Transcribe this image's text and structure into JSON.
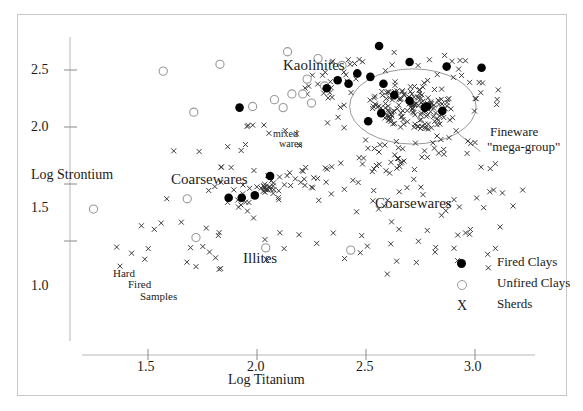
{
  "chart_data": {
    "type": "scatter",
    "title": "",
    "xlabel": "Log Titanium",
    "ylabel": "Log Strontium",
    "xlim": [
      1.22,
      3.26
    ],
    "ylim": [
      0.62,
      2.82
    ],
    "xticks": [
      1.5,
      2.0,
      2.5,
      3.0
    ],
    "xtick_labels": [
      "1.5",
      "2.0",
      "2.5",
      "3.0"
    ],
    "yticks": [
      1.0,
      1.5,
      2.0,
      2.5
    ],
    "ytick_labels": [
      "1.0",
      "1.5",
      "2.0",
      "2.5"
    ],
    "grid": false,
    "legend_position": "lower-right",
    "series": [
      {
        "name": "Fired Clays",
        "marker": "filled-circle",
        "color": "#000000",
        "points": [
          [
            2.56,
            2.71
          ],
          [
            2.7,
            2.57
          ],
          [
            2.87,
            2.53
          ],
          [
            3.03,
            2.52
          ],
          [
            2.46,
            2.47
          ],
          [
            2.52,
            2.44
          ],
          [
            2.37,
            2.41
          ],
          [
            2.42,
            2.38
          ],
          [
            2.32,
            2.34
          ],
          [
            2.58,
            2.38
          ],
          [
            2.63,
            2.28
          ],
          [
            2.7,
            2.23
          ],
          [
            2.77,
            2.17
          ],
          [
            2.85,
            2.14
          ],
          [
            1.92,
            2.17
          ],
          [
            2.57,
            2.12
          ],
          [
            2.06,
            1.57
          ],
          [
            1.87,
            1.38
          ],
          [
            1.93,
            1.38
          ],
          [
            1.99,
            1.4
          ],
          [
            2.78,
            2.18
          ],
          [
            2.51,
            2.05
          ]
        ]
      },
      {
        "name": "Unfired Clays",
        "marker": "open-circle",
        "color": "#9a9a9a",
        "points": [
          [
            2.14,
            2.66
          ],
          [
            1.83,
            2.55
          ],
          [
            2.39,
            2.54
          ],
          [
            1.57,
            2.49
          ],
          [
            2.23,
            2.42
          ],
          [
            2.31,
            2.36
          ],
          [
            2.16,
            2.29
          ],
          [
            2.21,
            2.29
          ],
          [
            2.08,
            2.24
          ],
          [
            2.25,
            2.21
          ],
          [
            1.98,
            2.18
          ],
          [
            2.12,
            2.17
          ],
          [
            1.71,
            2.13
          ],
          [
            2.28,
            2.6
          ],
          [
            1.25,
            1.28
          ],
          [
            1.72,
            1.03
          ],
          [
            2.04,
            0.94
          ],
          [
            2.43,
            0.92
          ],
          [
            1.68,
            1.37
          ]
        ]
      },
      {
        "name": "Sherds",
        "marker": "x",
        "color": "#333333",
        "note": "Approximately 300 sherd points; the densest concentration lies inside the Fineware mega-group ellipse centred near (2.72, 2.18)."
      }
    ],
    "annotations": [
      {
        "text": "Kaolinites",
        "x": 2.42,
        "y": 2.56,
        "style": "big"
      },
      {
        "text": "Coarsewares",
        "x": 1.83,
        "y": 1.76,
        "style": "big"
      },
      {
        "text": "Coarsewares",
        "x": 2.68,
        "y": 1.6,
        "style": "big"
      },
      {
        "text": "Illites",
        "x": 2.0,
        "y": 1.18,
        "style": "big"
      },
      {
        "text": "mixed wares",
        "x": 2.24,
        "y": 2.02,
        "style": "small"
      },
      {
        "text": "Hard Fired Samples",
        "x": 1.48,
        "y": 1.06,
        "style": "small"
      },
      {
        "text": "Fineware \"mega-group\"",
        "x": 3.02,
        "y": 1.98,
        "style": "note"
      }
    ],
    "ellipse": {
      "label": "Fineware \"mega-group\"",
      "center_x": 2.715,
      "center_y": 2.18,
      "radius_x": 0.29,
      "radius_y": 0.33
    }
  },
  "axes": {
    "x_title": "Log Titanium",
    "y_title": "Log Strontium",
    "x_tick_labels": [
      "1.5",
      "2.0",
      "2.5",
      "3.0"
    ],
    "y_tick_labels": [
      "1.0",
      "1.5",
      "2.0",
      "2.5"
    ]
  },
  "labels": {
    "kaolinites": "Kaolinites",
    "coarsewares_left": "Coarsewares",
    "coarsewares_right": "Coarsewares",
    "illites": "Illites",
    "mixed": "mixed",
    "wares": "wares",
    "hard": "Hard",
    "fired": "Fired",
    "samples": "Samples",
    "fineware_line1": "Fineware",
    "fineware_line2": "\"mega-group\""
  },
  "legend": {
    "items": [
      {
        "label": "Fired Clays",
        "marker": "filled-circle"
      },
      {
        "label": "Unfired Clays",
        "marker": "open-circle"
      },
      {
        "label": "Sherds",
        "marker": "x"
      }
    ]
  },
  "colors": {
    "fired": "#000000",
    "unfired": "#9a9a9a",
    "sherd": "#333333",
    "frame": "#c8c8c8",
    "axis": "#b0b0b0"
  }
}
